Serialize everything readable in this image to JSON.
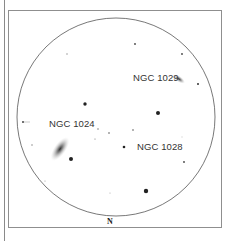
{
  "finder_chart": {
    "field_labels": {
      "ngc1029": "NGC 1029",
      "ngc1024": "NGC 1024",
      "ngc1028": "NGC 1028"
    },
    "orientation": {
      "north": "N"
    },
    "colors": {
      "frame": "#8f8f8f",
      "circle": "#555555",
      "stars": "#222222",
      "text": "#333333"
    }
  }
}
